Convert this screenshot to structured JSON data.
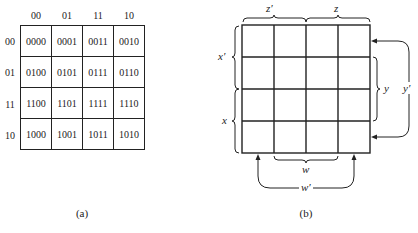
{
  "panel_a": {
    "caption": "(a)",
    "col_headers": [
      "00",
      "01",
      "11",
      "10"
    ],
    "row_headers": [
      "00",
      "01",
      "11",
      "10"
    ],
    "cells": [
      [
        "0000",
        "0001",
        "0011",
        "0010"
      ],
      [
        "0100",
        "0101",
        "0111",
        "0110"
      ],
      [
        "1100",
        "1101",
        "1111",
        "1110"
      ],
      [
        "1000",
        "1001",
        "1011",
        "1010"
      ]
    ]
  },
  "panel_b": {
    "caption": "(b)",
    "labels": {
      "z_prime": "z′",
      "z": "z",
      "x_prime": "x′",
      "x": "x",
      "y": "y",
      "y_prime": "y′",
      "w": "w",
      "w_prime": "w′"
    }
  }
}
